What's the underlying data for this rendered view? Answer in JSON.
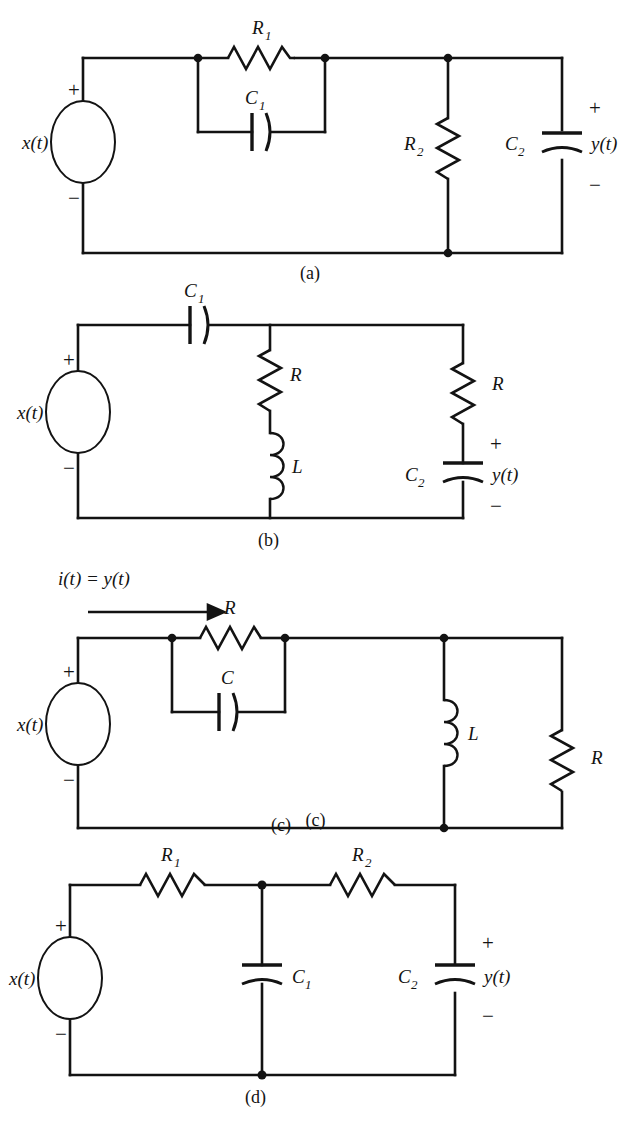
{
  "figure": {
    "background_color": "#ffffff",
    "line_color": "#131313"
  },
  "circuits": [
    {
      "caption": "(a)",
      "source_label": "x(t)",
      "plus_sign": "+",
      "minus_sign": "−",
      "output_label": "y(t)",
      "out_plus": "+",
      "out_minus": "−",
      "components": [
        {
          "name": "resistor-r1",
          "base": "R",
          "sub": "1",
          "orientation": "horizontal"
        },
        {
          "name": "capacitor-c1",
          "base": "C",
          "sub": "1",
          "orientation": "horizontal"
        },
        {
          "name": "resistor-r2",
          "base": "R",
          "sub": "2",
          "orientation": "vertical"
        },
        {
          "name": "capacitor-c2",
          "base": "C",
          "sub": "2",
          "orientation": "vertical"
        }
      ]
    },
    {
      "caption": "(b)",
      "source_label": "x(t)",
      "plus_sign": "+",
      "minus_sign": "−",
      "output_label": "y(t)",
      "out_plus": "+",
      "out_minus": "−",
      "components": [
        {
          "name": "capacitor-c1",
          "base": "C",
          "sub": "1",
          "orientation": "horizontal"
        },
        {
          "name": "resistor-r-middle",
          "base": "R",
          "sub": "",
          "orientation": "vertical"
        },
        {
          "name": "inductor-l",
          "base": "L",
          "sub": "",
          "orientation": "vertical"
        },
        {
          "name": "resistor-r-right",
          "base": "R",
          "sub": "",
          "orientation": "vertical"
        },
        {
          "name": "capacitor-c2",
          "base": "C",
          "sub": "2",
          "orientation": "vertical"
        }
      ]
    },
    {
      "caption": "(c)",
      "source_label": "x(t)",
      "plus_sign": "+",
      "minus_sign": "−",
      "current_label": "i(t) = y(t)",
      "components": [
        {
          "name": "resistor-r-top",
          "base": "R",
          "sub": "",
          "orientation": "horizontal"
        },
        {
          "name": "capacitor-c",
          "base": "C",
          "sub": "",
          "orientation": "horizontal"
        },
        {
          "name": "inductor-l",
          "base": "L",
          "sub": "",
          "orientation": "vertical"
        },
        {
          "name": "resistor-r-right",
          "base": "R",
          "sub": "",
          "orientation": "vertical"
        }
      ]
    },
    {
      "caption": "(d)",
      "source_label": "x(t)",
      "plus_sign": "+",
      "minus_sign": "−",
      "output_label": "y(t)",
      "out_plus": "+",
      "out_minus": "−",
      "components": [
        {
          "name": "resistor-r1",
          "base": "R",
          "sub": "1",
          "orientation": "horizontal"
        },
        {
          "name": "resistor-r2",
          "base": "R",
          "sub": "2",
          "orientation": "horizontal"
        },
        {
          "name": "capacitor-c1",
          "base": "C",
          "sub": "1",
          "orientation": "vertical"
        },
        {
          "name": "capacitor-c2",
          "base": "C",
          "sub": "2",
          "orientation": "vertical"
        }
      ]
    }
  ]
}
